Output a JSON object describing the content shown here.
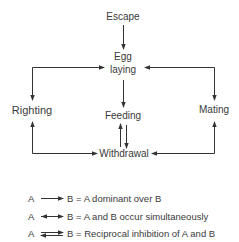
{
  "diagram": {
    "nodes": {
      "escape": "Escape",
      "egg_laying_line1": "Egg",
      "egg_laying_line2": "laying",
      "righting": "Righting",
      "feeding": "Feeding",
      "mating": "Mating",
      "withdrawal": "Withdrawal"
    },
    "edges": [
      {
        "from": "Escape",
        "to": "Egg laying",
        "type": "dominant"
      },
      {
        "from": "Egg laying",
        "to": "Feeding",
        "type": "dominant"
      },
      {
        "from": "Egg laying",
        "to": "Righting",
        "type": "simultaneous"
      },
      {
        "from": "Egg laying",
        "to": "Mating",
        "type": "simultaneous"
      },
      {
        "from": "Feeding",
        "to": "Withdrawal",
        "type": "reciprocal inhibition"
      },
      {
        "from": "Withdrawal",
        "to": "Righting",
        "type": "simultaneous"
      },
      {
        "from": "Withdrawal",
        "to": "Mating",
        "type": "simultaneous"
      }
    ],
    "colors": {
      "line": "#333333",
      "text": "#3a3a3a"
    }
  },
  "legend": {
    "items": [
      {
        "a": "A",
        "b": "B",
        "text": "= A dominant over B"
      },
      {
        "a": "A",
        "b": "B",
        "text": "= A and B occur simultaneously"
      },
      {
        "a": "A",
        "b": "B",
        "text": "= Reciprocal inhibition of A and B"
      }
    ]
  }
}
